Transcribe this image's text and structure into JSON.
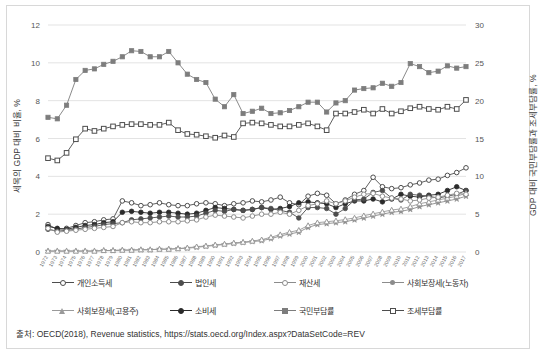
{
  "figure": {
    "source_note": "출처: OECD(2018), Revenue statistics, https://stats.oecd.org/Index.aspx?DataSetCode=REV"
  },
  "axis": {
    "left_title": "세목의 GDP 대비 비율, %",
    "right_title": "GDP 대비 국민부담률과 조세부담률, %",
    "left_ticks": [
      "0",
      "2",
      "4",
      "6",
      "8",
      "10",
      "12"
    ],
    "right_ticks": [
      "0",
      "5",
      "10",
      "15",
      "20",
      "25",
      "30"
    ]
  },
  "legend": {
    "rows": [
      [
        {
          "label": "개인소득세",
          "marker": "circle-open",
          "color": "#4d4d4d"
        },
        {
          "label": "법인세",
          "marker": "circle-filled",
          "color": "#4d4d4d"
        },
        {
          "label": "재산세",
          "marker": "circle-open",
          "color": "#8c8c8c"
        },
        {
          "label": "사회보장세(노동자)",
          "marker": "star",
          "color": "#8c8c8c"
        }
      ],
      [
        {
          "label": "사회보장세(고용주)",
          "marker": "triangle-open",
          "color": "#9a9a9a"
        },
        {
          "label": "소비세",
          "marker": "circle-filled",
          "color": "#2b2b2b"
        },
        {
          "label": "국민부담률",
          "marker": "square-filled",
          "color": "#7d7d7d"
        },
        {
          "label": "조세부담률",
          "marker": "square-open",
          "color": "#4d4d4d"
        }
      ]
    ]
  },
  "chart_data": {
    "type": "line",
    "title": "",
    "xlabel": "",
    "ylabel": "세목의 GDP 대비 비율, %",
    "y2label": "GDP 대비 국민부담률과 조세부담률, %",
    "ylim": [
      0,
      12
    ],
    "y2lim": [
      0,
      30
    ],
    "grid": true,
    "legend_position": "bottom",
    "x": [
      "1972",
      "1973",
      "1974",
      "1975",
      "1976",
      "1977",
      "1978",
      "1979",
      "1980",
      "1981",
      "1982",
      "1983",
      "1984",
      "1985",
      "1986",
      "1987",
      "1988",
      "1989",
      "1990",
      "1991",
      "1992",
      "1993",
      "1994",
      "1995",
      "1996",
      "1997",
      "1998",
      "1999",
      "2000",
      "2001",
      "2002",
      "2003",
      "2004",
      "2005",
      "2006",
      "2007",
      "2008",
      "2009",
      "2010",
      "2011",
      "2012",
      "2013",
      "2014",
      "2015",
      "2016",
      "2017"
    ],
    "series": [
      {
        "name": "국민부담률",
        "axis": "right",
        "marker": "square-filled",
        "color": "#7d7d7d",
        "values": [
          17.8,
          17.6,
          19.4,
          22.8,
          24.0,
          24.2,
          24.8,
          25.2,
          25.8,
          26.6,
          26.5,
          25.8,
          25.8,
          26.5,
          25.0,
          23.5,
          22.8,
          22.4,
          20.2,
          19.2,
          20.8,
          18.3,
          18.6,
          19.0,
          18.3,
          18.4,
          18.7,
          19.2,
          19.8,
          19.8,
          18.5,
          19.7,
          20.0,
          21.4,
          21.6,
          21.7,
          22.3,
          21.9,
          22.4,
          24.9,
          24.5,
          23.7,
          23.9,
          24.6,
          24.3,
          24.5
        ]
      },
      {
        "name": "조세부담률",
        "axis": "right",
        "marker": "square-open",
        "color": "#4d4d4d",
        "values": [
          12.4,
          12.1,
          13.1,
          14.9,
          16.3,
          16.0,
          16.3,
          16.6,
          16.8,
          16.9,
          16.9,
          16.8,
          16.8,
          17.1,
          16.1,
          15.6,
          15.5,
          15.3,
          15.1,
          15.4,
          15.2,
          17.0,
          17.1,
          17.0,
          16.8,
          16.6,
          16.6,
          16.8,
          17.0,
          16.6,
          16.1,
          18.3,
          18.3,
          18.5,
          18.8,
          18.3,
          18.9,
          18.3,
          18.6,
          19.0,
          19.2,
          18.9,
          18.8,
          19.2,
          18.9,
          20.1
        ]
      },
      {
        "name": "개인소득세",
        "axis": "left",
        "marker": "circle-open",
        "color": "#4d4d4d",
        "values": [
          1.45,
          1.2,
          1.25,
          1.4,
          1.55,
          1.6,
          1.7,
          1.75,
          2.7,
          2.6,
          2.45,
          2.5,
          2.6,
          2.5,
          2.45,
          2.45,
          2.55,
          2.6,
          2.55,
          2.45,
          2.55,
          2.6,
          2.7,
          2.65,
          2.75,
          2.9,
          2.6,
          2.5,
          2.95,
          3.1,
          3.0,
          2.55,
          2.75,
          3.05,
          3.25,
          3.95,
          3.45,
          3.35,
          3.4,
          3.55,
          3.65,
          3.8,
          3.85,
          4.05,
          4.2,
          4.45
        ]
      },
      {
        "name": "소비세",
        "axis": "left",
        "marker": "circle-filled",
        "color": "#2b2b2b",
        "values": [
          1.35,
          1.25,
          1.2,
          1.3,
          1.4,
          1.45,
          1.55,
          1.6,
          2.1,
          2.15,
          2.1,
          2.05,
          2.1,
          2.1,
          2.05,
          2.0,
          2.05,
          2.2,
          2.35,
          2.3,
          2.25,
          2.2,
          2.25,
          2.35,
          2.25,
          2.3,
          2.4,
          2.6,
          2.65,
          2.6,
          2.55,
          2.35,
          2.55,
          2.7,
          2.7,
          2.8,
          2.65,
          2.8,
          3.05,
          2.95,
          2.9,
          3.0,
          3.05,
          3.25,
          3.45,
          3.25
        ]
      },
      {
        "name": "법인세",
        "axis": "left",
        "marker": "circle-filled",
        "color": "#4d4d4d",
        "values": [
          1.2,
          1.1,
          1.15,
          1.2,
          1.3,
          1.35,
          1.45,
          1.5,
          1.55,
          1.7,
          1.75,
          1.8,
          1.85,
          1.9,
          1.85,
          1.85,
          1.9,
          2.05,
          2.2,
          2.15,
          2.25,
          2.2,
          2.25,
          2.35,
          2.3,
          2.2,
          2.1,
          1.8,
          2.35,
          2.35,
          2.3,
          2.0,
          2.3,
          2.75,
          2.8,
          3.15,
          3.25,
          2.85,
          2.75,
          3.05,
          3.0,
          2.95,
          2.85,
          2.95,
          3.05,
          3.25
        ]
      },
      {
        "name": "사회보장세(노동자)",
        "axis": "left",
        "marker": "star",
        "color": "#8c8c8c",
        "values": [
          0.05,
          0.05,
          0.05,
          0.05,
          0.05,
          0.05,
          0.08,
          0.08,
          0.1,
          0.1,
          0.12,
          0.12,
          0.15,
          0.15,
          0.18,
          0.2,
          0.25,
          0.3,
          0.35,
          0.4,
          0.45,
          0.5,
          0.55,
          0.6,
          0.7,
          0.85,
          0.95,
          1.05,
          1.3,
          1.45,
          1.5,
          1.55,
          1.6,
          1.7,
          1.8,
          1.9,
          2.0,
          2.1,
          2.15,
          2.25,
          2.4,
          2.5,
          2.6,
          2.7,
          2.8,
          2.95
        ]
      },
      {
        "name": "사회보장세(고용주)",
        "axis": "left",
        "marker": "triangle-open",
        "color": "#9a9a9a",
        "values": [
          0.05,
          0.05,
          0.05,
          0.05,
          0.05,
          0.05,
          0.08,
          0.08,
          0.1,
          0.1,
          0.12,
          0.12,
          0.15,
          0.15,
          0.18,
          0.22,
          0.28,
          0.32,
          0.38,
          0.42,
          0.48,
          0.52,
          0.58,
          0.65,
          0.78,
          0.92,
          1.05,
          1.15,
          1.4,
          1.55,
          1.6,
          1.65,
          1.72,
          1.8,
          1.92,
          2.02,
          2.12,
          2.22,
          2.28,
          2.4,
          2.55,
          2.65,
          2.75,
          2.85,
          2.95,
          3.1
        ]
      },
      {
        "name": "재산세",
        "axis": "left",
        "marker": "circle-open",
        "color": "#8c8c8c",
        "values": [
          1.25,
          1.05,
          1.1,
          1.15,
          1.2,
          1.25,
          1.3,
          1.35,
          1.55,
          1.6,
          1.55,
          1.55,
          1.6,
          1.6,
          1.6,
          1.65,
          1.7,
          1.85,
          1.95,
          1.9,
          1.85,
          1.8,
          1.9,
          2.0,
          2.0,
          2.1,
          2.0,
          2.2,
          2.45,
          2.55,
          2.7,
          2.55,
          2.7,
          2.9,
          3.05,
          3.1,
          2.95,
          2.85,
          2.8,
          2.7,
          2.75,
          2.85,
          2.9,
          3.0,
          3.1,
          3.05
        ]
      }
    ]
  }
}
